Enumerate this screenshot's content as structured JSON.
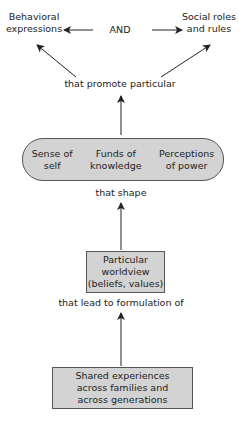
{
  "diagram": {
    "top_left": {
      "line1": "Behavioral",
      "line2": "expressions"
    },
    "top_connector": "AND",
    "top_right": {
      "line1": "Social roles",
      "line2": "and rules"
    },
    "label_promote": "that promote particular",
    "pill": {
      "items": [
        {
          "line1": "Sense of",
          "line2": "self"
        },
        {
          "line1": "Funds of",
          "line2": "knowledge"
        },
        {
          "line1": "Perceptions",
          "line2": "of power"
        }
      ]
    },
    "label_shape": "that shape",
    "worldview_box": {
      "line1": "Particular",
      "line2": "worldview",
      "line3": "(beliefs, values)"
    },
    "label_lead": "that lead to formulation of",
    "experiences_box": {
      "line1": "Shared experiences",
      "line2": "across families and",
      "line3": "across generations"
    },
    "colors": {
      "box_fill": "#d3d3d3",
      "box_border": "#555555",
      "arrow": "#222222"
    }
  }
}
